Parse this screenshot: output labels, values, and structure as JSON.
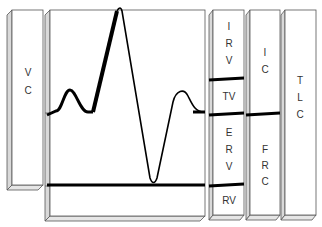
{
  "diagram": {
    "type": "lung-volumes-spirogram",
    "colors": {
      "line": "#000000",
      "border": "#555555",
      "bevel": "#d9d9d9",
      "background": "#ffffff"
    },
    "labels": {
      "vc": [
        "V",
        "C"
      ],
      "irv": [
        "I",
        "R",
        "V"
      ],
      "tv": "TV",
      "erv": [
        "E",
        "R",
        "V"
      ],
      "rv": "RV",
      "ic": [
        "I",
        "C"
      ],
      "frc": [
        "F",
        "R",
        "C"
      ],
      "tlc": [
        "T",
        "L",
        "C"
      ]
    },
    "columns": [
      {
        "name": "VC",
        "segments": [
          "VC"
        ]
      },
      {
        "name": "spirogram-trace",
        "segments": [
          "tidal breathing",
          "maximal inspiration",
          "maximal expiration",
          "tidal breathing"
        ]
      },
      {
        "name": "subdivisions",
        "segments": [
          "IRV",
          "TV",
          "ERV",
          "RV"
        ]
      },
      {
        "name": "capacities",
        "segments": [
          "IC",
          "FRC"
        ]
      },
      {
        "name": "total",
        "segments": [
          "TLC"
        ]
      }
    ]
  }
}
